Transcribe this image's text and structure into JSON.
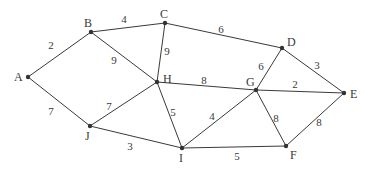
{
  "diagram": {
    "type": "weighted-undirected-graph",
    "nodes": [
      {
        "id": "A",
        "x": 28,
        "y": 77,
        "label": "A",
        "lx": 14,
        "ly": 81
      },
      {
        "id": "B",
        "x": 91,
        "y": 32,
        "label": "B",
        "lx": 84,
        "ly": 27
      },
      {
        "id": "C",
        "x": 165,
        "y": 23,
        "label": "C",
        "lx": 160,
        "ly": 18
      },
      {
        "id": "D",
        "x": 282,
        "y": 48,
        "label": "D",
        "lx": 287,
        "ly": 46
      },
      {
        "id": "E",
        "x": 344,
        "y": 93,
        "label": "E",
        "lx": 350,
        "ly": 98
      },
      {
        "id": "F",
        "x": 286,
        "y": 146,
        "label": "F",
        "lx": 290,
        "ly": 159
      },
      {
        "id": "G",
        "x": 256,
        "y": 90,
        "label": "G",
        "lx": 246,
        "ly": 86
      },
      {
        "id": "H",
        "x": 157,
        "y": 82,
        "label": "H",
        "lx": 163,
        "ly": 83
      },
      {
        "id": "I",
        "x": 182,
        "y": 148,
        "label": "I",
        "lx": 179,
        "ly": 162
      },
      {
        "id": "J",
        "x": 90,
        "y": 126,
        "label": "J",
        "lx": 85,
        "ly": 140
      }
    ],
    "edges": [
      {
        "from": "A",
        "to": "B",
        "weight": "2",
        "wx": 51,
        "wy": 49
      },
      {
        "from": "B",
        "to": "C",
        "weight": "4",
        "wx": 124,
        "wy": 23
      },
      {
        "from": "C",
        "to": "D",
        "weight": "6",
        "wx": 221,
        "wy": 33
      },
      {
        "from": "D",
        "to": "E",
        "weight": "3",
        "wx": 317,
        "wy": 69
      },
      {
        "from": "B",
        "to": "H",
        "weight": "9",
        "wx": 114,
        "wy": 64
      },
      {
        "from": "C",
        "to": "H",
        "weight": "9",
        "wx": 167,
        "wy": 55
      },
      {
        "from": "H",
        "to": "G",
        "weight": "8",
        "wx": 204,
        "wy": 84
      },
      {
        "from": "D",
        "to": "G",
        "weight": "6",
        "wx": 261,
        "wy": 70
      },
      {
        "from": "G",
        "to": "E",
        "weight": "2",
        "wx": 295,
        "wy": 88
      },
      {
        "from": "A",
        "to": "J",
        "weight": "7",
        "wx": 51,
        "wy": 115
      },
      {
        "from": "J",
        "to": "H",
        "weight": "7",
        "wx": 109,
        "wy": 110
      },
      {
        "from": "H",
        "to": "I",
        "weight": "5",
        "wx": 173,
        "wy": 116
      },
      {
        "from": "I",
        "to": "G",
        "weight": "4",
        "wx": 212,
        "wy": 120
      },
      {
        "from": "G",
        "to": "F",
        "weight": "8",
        "wx": 276,
        "wy": 122
      },
      {
        "from": "F",
        "to": "E",
        "weight": "8",
        "wx": 319,
        "wy": 126
      },
      {
        "from": "J",
        "to": "I",
        "weight": "3",
        "wx": 130,
        "wy": 150
      },
      {
        "from": "I",
        "to": "F",
        "weight": "5",
        "wx": 237,
        "wy": 160
      }
    ]
  }
}
